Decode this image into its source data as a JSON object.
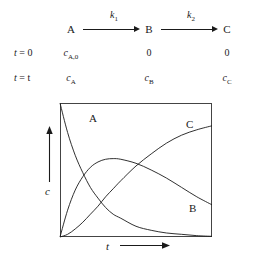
{
  "figure": {
    "type": "kinetics-scheme-and-concentration-plot"
  },
  "scheme": {
    "species": [
      {
        "label": "A"
      },
      {
        "label": "B"
      },
      {
        "label": "C"
      }
    ],
    "rate_constants": [
      {
        "symbol": "k",
        "subscript": "1"
      },
      {
        "symbol": "k",
        "subscript": "2"
      }
    ],
    "rows": [
      {
        "time_label": "t = 0",
        "time_var": "t",
        "time_value": "0",
        "values": [
          {
            "symbol": "c",
            "subscript": "A,0"
          },
          {
            "symbol": "",
            "plain": "0"
          },
          {
            "symbol": "",
            "plain": "0"
          }
        ]
      },
      {
        "time_label": "t = t",
        "time_var": "t",
        "time_value": "t",
        "values": [
          {
            "symbol": "c",
            "subscript": "A"
          },
          {
            "symbol": "c",
            "subscript": "B"
          },
          {
            "symbol": "c",
            "subscript": "C"
          }
        ]
      }
    ]
  },
  "chart_data": {
    "type": "line",
    "title": "",
    "xlabel": "t",
    "ylabel": "c",
    "xlim": [
      0,
      1
    ],
    "ylim": [
      0,
      1
    ],
    "grid": false,
    "legend": "inline-curve-labels",
    "axis_ticks": "none",
    "x": [
      0,
      0.05,
      0.1,
      0.15,
      0.2,
      0.25,
      0.3,
      0.35,
      0.4,
      0.5,
      0.6,
      0.7,
      0.8,
      0.9,
      1.0
    ],
    "series": [
      {
        "name": "A",
        "label": "A",
        "description": "reactant A decays exponentially from its initial concentration",
        "values": [
          1.0,
          0.78,
          0.61,
          0.48,
          0.37,
          0.29,
          0.22,
          0.17,
          0.14,
          0.08,
          0.05,
          0.03,
          0.02,
          0.01,
          0.005
        ]
      },
      {
        "name": "B",
        "label": "B",
        "description": "intermediate B rises to a maximum then decays",
        "values": [
          0.0,
          0.2,
          0.35,
          0.45,
          0.52,
          0.56,
          0.58,
          0.585,
          0.58,
          0.55,
          0.5,
          0.44,
          0.37,
          0.3,
          0.24
        ]
      },
      {
        "name": "C",
        "label": "C",
        "description": "product C rises sigmoidally toward a plateau",
        "values": [
          0.0,
          0.02,
          0.06,
          0.11,
          0.17,
          0.23,
          0.3,
          0.36,
          0.42,
          0.53,
          0.62,
          0.7,
          0.76,
          0.8,
          0.83
        ]
      }
    ],
    "curve_labels": [
      {
        "series": "A",
        "text": "A"
      },
      {
        "series": "B",
        "text": "B"
      },
      {
        "series": "C",
        "text": "C"
      }
    ]
  }
}
